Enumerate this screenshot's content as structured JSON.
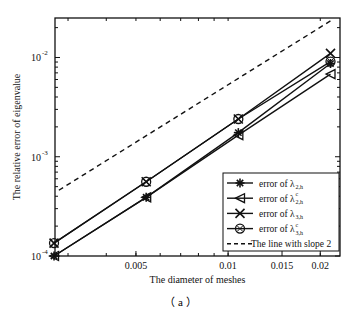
{
  "chart_data": {
    "type": "line",
    "title": "",
    "xlabel": "The diameter of meshes",
    "ylabel": "The relative error of eigenvalue",
    "xscale": "log",
    "yscale": "log",
    "xlim": [
      0.00272,
      0.0232
    ],
    "ylim": [
      0.0001,
      0.025
    ],
    "xticks": [
      0.005,
      0.01,
      0.015,
      0.02
    ],
    "xtick_labels": [
      "0.005",
      "0.01",
      "0.015",
      "0.02"
    ],
    "yticks": [
      0.0001,
      0.001,
      0.01
    ],
    "ytick_labels": [
      {
        "base": "10",
        "exp": "-4"
      },
      {
        "base": "10",
        "exp": "-3"
      },
      {
        "base": "10",
        "exp": "-2"
      }
    ],
    "grid": false,
    "legend_position": "lower-right",
    "x": [
      0.0027,
      0.0054,
      0.0108,
      0.0216
    ],
    "series": [
      {
        "name": "error of λ2,h",
        "label_main": "error of λ",
        "label_sub": "2,h",
        "label_sup": "",
        "marker": "star",
        "line": "solid",
        "values": [
          0.0001,
          0.00039,
          0.00175,
          0.0087
        ]
      },
      {
        "name": "error of λc2,h",
        "label_main": "error of λ",
        "label_sub": "2,h",
        "label_sup": "c",
        "marker": "triangle-left",
        "line": "solid",
        "values": [
          0.0001,
          0.00039,
          0.00165,
          0.0068
        ]
      },
      {
        "name": "error of λ3,h",
        "label_main": "error of λ",
        "label_sub": "3,h",
        "label_sup": "",
        "marker": "x",
        "line": "solid",
        "values": [
          0.000135,
          0.00056,
          0.0024,
          0.011
        ]
      },
      {
        "name": "error of λc3,h",
        "label_main": "error of λ",
        "label_sub": "3,h",
        "label_sup": "c",
        "marker": "circle-x",
        "line": "solid",
        "values": [
          0.000135,
          0.00056,
          0.0024,
          0.0091
        ]
      },
      {
        "name": "The line with slope 2",
        "label_main": "The line with slope 2",
        "label_sub": "",
        "label_sup": "",
        "marker": "none",
        "line": "dashed",
        "x": [
          0.0028,
          0.0219
        ],
        "values": [
          0.00046,
          0.024
        ]
      }
    ],
    "colors": {
      "line": "#111111",
      "axis": "#111111",
      "background": "#ffffff"
    }
  },
  "caption": "（ a ）"
}
